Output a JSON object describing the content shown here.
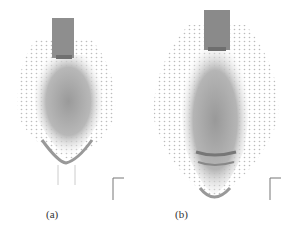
{
  "figure": {
    "panels": [
      {
        "id": "a",
        "caption": "(a)",
        "axis_labels": {
          "x": "x",
          "y": "z"
        }
      },
      {
        "id": "b",
        "caption": "(b)",
        "axis_labels": {
          "x": "x",
          "y": "z"
        }
      }
    ]
  }
}
